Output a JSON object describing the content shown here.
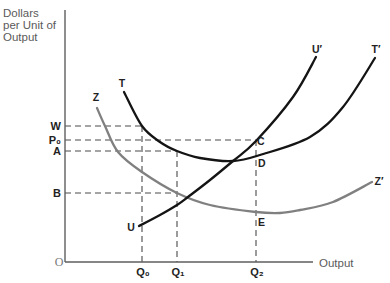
{
  "chart_data": {
    "type": "line",
    "title": "",
    "xlabel": "Output",
    "ylabel": "Dollars per Unit of Output",
    "ylabel_lines": [
      "Dollars",
      "per Unit of",
      "Output"
    ],
    "origin_label": "O",
    "xlim": [
      0,
      248
    ],
    "ylim": [
      0,
      252
    ],
    "grid": false,
    "legend": null,
    "x_ticks": [
      {
        "label": "Q₀",
        "x": 77,
        "guide_from_y": 136
      },
      {
        "label": "Q₁",
        "x": 112,
        "guide_from_y": 111
      },
      {
        "label": "Q₂",
        "x": 191,
        "guide_from_y": 122
      }
    ],
    "y_ticks": [
      {
        "label": "W",
        "y": 136,
        "guide_to_x": 77
      },
      {
        "label": "P₀",
        "y": 122,
        "guide_to_x": 191
      },
      {
        "label": "A",
        "y": 111,
        "guide_to_x": 112
      },
      {
        "label": "B",
        "y": 69,
        "guide_to_x": 112
      }
    ],
    "series": [
      {
        "name": "T",
        "end_label": "T′",
        "color": "#141414",
        "start_label_pos": [
          57,
          175
        ],
        "end_label_pos": [
          311,
          209
        ],
        "points": [
          [
            59,
            170
          ],
          [
            77,
            136
          ],
          [
            95,
            120
          ],
          [
            112,
            111
          ],
          [
            135,
            104
          ],
          [
            168,
            101
          ],
          [
            195,
            107
          ],
          [
            245,
            125
          ],
          [
            278,
            155
          ],
          [
            310,
            204
          ]
        ]
      },
      {
        "name": "U",
        "end_label": "U′",
        "color": "#141414",
        "start_label_pos": [
          66,
          31
        ],
        "end_label_pos": [
          252,
          209
        ],
        "points": [
          [
            74,
            36
          ],
          [
            95,
            47
          ],
          [
            112,
            57
          ],
          [
            123,
            65
          ],
          [
            145,
            82
          ],
          [
            168,
            101
          ],
          [
            191,
            121
          ],
          [
            228,
            165
          ],
          [
            251,
            205
          ]
        ]
      },
      {
        "name": "Z",
        "end_label": "Z′",
        "color": "#808080",
        "start_label_pos": [
          31,
          161
        ],
        "end_label_pos": [
          314,
          77
        ],
        "points": [
          [
            32,
            154
          ],
          [
            40,
            136
          ],
          [
            53,
            110
          ],
          [
            77,
            90
          ],
          [
            112,
            69
          ],
          [
            145,
            57
          ],
          [
            191,
            50
          ],
          [
            215,
            49
          ],
          [
            235,
            52
          ],
          [
            268,
            60
          ],
          [
            307,
            80
          ]
        ]
      }
    ],
    "point_labels": [
      {
        "label": "C",
        "x": 192,
        "y": 117
      },
      {
        "label": "D",
        "x": 193,
        "y": 95
      },
      {
        "label": "E",
        "x": 193,
        "y": 36
      }
    ]
  }
}
